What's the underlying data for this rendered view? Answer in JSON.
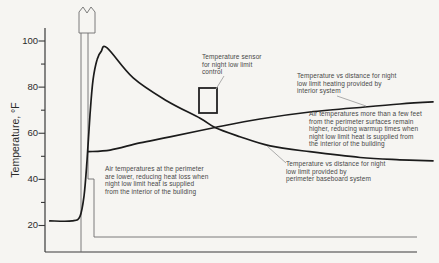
{
  "figure": {
    "y_axis_label": "Temperature, °F",
    "y_tick_labels": [
      "100",
      "80",
      "60",
      "40",
      "20"
    ]
  },
  "annotations": {
    "sensor_label": "Temperature sensor\nfor night low limit\ncontrol",
    "interior_curve_label": "Temperature vs distance for night\nlow limit heating provided by\ninterior system",
    "interior_note": "Air temperatures more than a few feet\nfrom the perimeter surfaces remain\nhigher, reducing warmup times when\nnight low limit heat is supplied from\nthe interior of the building",
    "baseboard_curve_label": "Temperature vs distance for night\nlow limit provided by\nperimeter baseboard system",
    "perimeter_note": "Air temperatures at the perimeter\nare lower, reducing heat loss when\nnight low limit heat is supplied\nfrom the interior of the building"
  },
  "chart_data": {
    "type": "line",
    "title": "",
    "xlabel": "",
    "ylabel": "Temperature, °F",
    "ylim": [
      12,
      105
    ],
    "yticks": [
      20,
      40,
      60,
      80,
      100
    ],
    "yticks_minor": [
      30,
      50,
      70,
      90
    ],
    "x_axis_unlabeled": true,
    "grid": false,
    "legend": "inline-annotations",
    "series": [
      {
        "name": "Temperature vs distance for night low limit provided by perimeter baseboard system",
        "points": [
          [
            1.3,
            22
          ],
          [
            7.3,
            22
          ],
          [
            9.4,
            24
          ],
          [
            10.5,
            33
          ],
          [
            11.3,
            48
          ],
          [
            12.1,
            68
          ],
          [
            12.9,
            83
          ],
          [
            14,
            92
          ],
          [
            15.1,
            95.5
          ],
          [
            16.7,
            97
          ],
          [
            23.7,
            84
          ],
          [
            32.8,
            74
          ],
          [
            41.7,
            66.5
          ],
          [
            45.7,
            62.5
          ],
          [
            52.4,
            58.5
          ],
          [
            60.5,
            54.5
          ],
          [
            71.2,
            52
          ],
          [
            84.7,
            49.5
          ],
          [
            95.4,
            48.5
          ],
          [
            104.3,
            48
          ]
        ]
      },
      {
        "name": "Temperature vs distance for night low limit heating provided by interior system",
        "points": [
          [
            11.6,
            52
          ],
          [
            17.5,
            52.7
          ],
          [
            25.5,
            55.8
          ],
          [
            33.6,
            58.4
          ],
          [
            45.7,
            62.5
          ],
          [
            57.8,
            66.2
          ],
          [
            71.2,
            69.2
          ],
          [
            86,
            71.4
          ],
          [
            95.4,
            72.7
          ],
          [
            104.3,
            73.6
          ]
        ]
      }
    ],
    "outdoor_temp_f": 22,
    "peak_temp_f": 97,
    "crossing_temp_f": 62.5
  },
  "colors": {
    "curve": "#1b1b1b",
    "axis": "#3a3a3a",
    "wall": "#6e6e6e",
    "sensor": "#222222",
    "leader": "#a3a3a3"
  }
}
